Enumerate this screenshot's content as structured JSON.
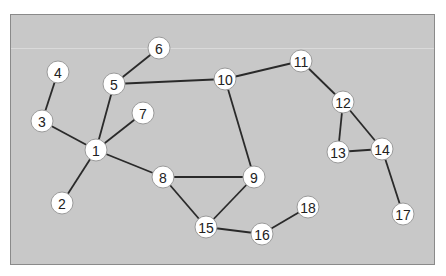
{
  "diagram": {
    "type": "undirected-graph",
    "colors": {
      "background": "#c8c8c8",
      "border": "#8a8a8a",
      "edge": "#2a2a2a",
      "node_fill": "#ffffff",
      "label": "#222222"
    },
    "node_radius": 11,
    "nodes": [
      {
        "id": "1",
        "label": "1",
        "x": 96,
        "y": 150
      },
      {
        "id": "2",
        "label": "2",
        "x": 62,
        "y": 203
      },
      {
        "id": "3",
        "label": "3",
        "x": 42,
        "y": 121
      },
      {
        "id": "4",
        "label": "4",
        "x": 58,
        "y": 72
      },
      {
        "id": "5",
        "label": "5",
        "x": 114,
        "y": 84
      },
      {
        "id": "6",
        "label": "6",
        "x": 159,
        "y": 48
      },
      {
        "id": "7",
        "label": "7",
        "x": 143,
        "y": 113
      },
      {
        "id": "8",
        "label": "8",
        "x": 163,
        "y": 177
      },
      {
        "id": "9",
        "label": "9",
        "x": 254,
        "y": 177
      },
      {
        "id": "10",
        "label": "10",
        "x": 225,
        "y": 79
      },
      {
        "id": "11",
        "label": "11",
        "x": 301,
        "y": 61
      },
      {
        "id": "12",
        "label": "12",
        "x": 343,
        "y": 102
      },
      {
        "id": "13",
        "label": "13",
        "x": 338,
        "y": 152
      },
      {
        "id": "14",
        "label": "14",
        "x": 382,
        "y": 149
      },
      {
        "id": "15",
        "label": "15",
        "x": 206,
        "y": 227
      },
      {
        "id": "16",
        "label": "16",
        "x": 262,
        "y": 234
      },
      {
        "id": "17",
        "label": "17",
        "x": 403,
        "y": 214
      },
      {
        "id": "18",
        "label": "18",
        "x": 308,
        "y": 207
      }
    ],
    "edges": [
      [
        "1",
        "2"
      ],
      [
        "1",
        "3"
      ],
      [
        "3",
        "4"
      ],
      [
        "1",
        "5"
      ],
      [
        "1",
        "7"
      ],
      [
        "1",
        "8"
      ],
      [
        "5",
        "6"
      ],
      [
        "5",
        "10"
      ],
      [
        "10",
        "11"
      ],
      [
        "10",
        "9"
      ],
      [
        "8",
        "9"
      ],
      [
        "8",
        "15"
      ],
      [
        "9",
        "15"
      ],
      [
        "15",
        "16"
      ],
      [
        "16",
        "18"
      ],
      [
        "11",
        "12"
      ],
      [
        "12",
        "13"
      ],
      [
        "12",
        "14"
      ],
      [
        "13",
        "14"
      ],
      [
        "14",
        "17"
      ]
    ]
  }
}
